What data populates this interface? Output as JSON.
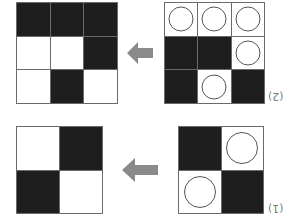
{
  "figure": {
    "orientation": "rotated 180 degrees",
    "colors": {
      "black": "#1e1e1e",
      "white": "#ffffff",
      "border": "#6a6a6a",
      "arrow": "#8a8a8a",
      "circle": "#555555"
    },
    "problems": [
      {
        "label": "(2)",
        "source": {
          "size": 3,
          "cells": [
            [
              "circle",
              "circle",
              "circle"
            ],
            [
              "black",
              "black",
              "circle"
            ],
            [
              "black",
              "circle",
              "black"
            ]
          ]
        },
        "result": {
          "size": 3,
          "cells": [
            [
              "black",
              "black",
              "black"
            ],
            [
              "white",
              "white",
              "black"
            ],
            [
              "white",
              "black",
              "white"
            ]
          ]
        },
        "arrow": "left-arrow"
      },
      {
        "label": "(1)",
        "source": {
          "size": 2,
          "cells": [
            [
              "black",
              "circle"
            ],
            [
              "circle",
              "black"
            ]
          ]
        },
        "result": {
          "size": 2,
          "cells": [
            [
              "white",
              "black"
            ],
            [
              "black",
              "white"
            ]
          ]
        },
        "arrow": "left-arrow"
      }
    ]
  }
}
